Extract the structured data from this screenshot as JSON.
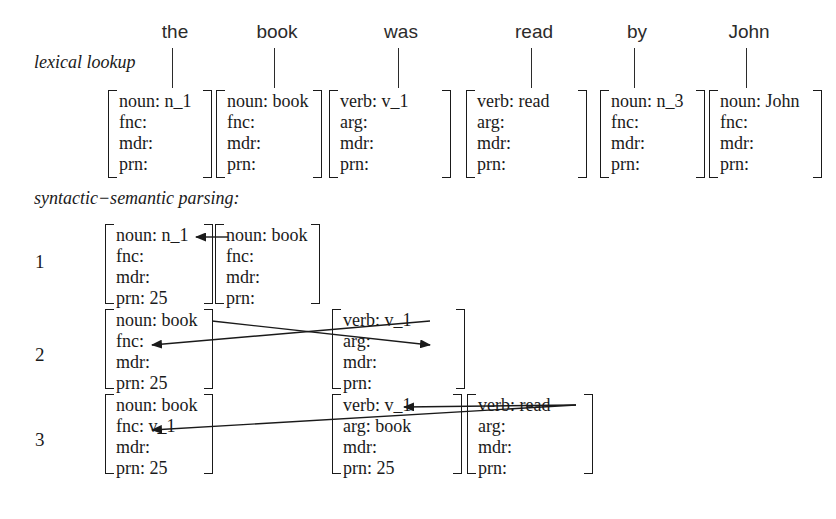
{
  "figure": {
    "title_sections": {
      "lexical": "lexical lookup",
      "parsing": "syntactic−semantic parsing:"
    },
    "sentence": [
      "the",
      "book",
      "was",
      "read",
      "by",
      "John"
    ],
    "colors": {
      "ink": "#1a1a1a",
      "word_ink": "#2b2b2b",
      "background": "#ffffff"
    }
  },
  "words": [
    {
      "text": "the",
      "cx": 175,
      "tick_top": 48,
      "tick_bottom": 88
    },
    {
      "text": "book",
      "cx": 277,
      "tick_top": 48,
      "tick_bottom": 88
    },
    {
      "text": "was",
      "cx": 401,
      "tick_top": 48,
      "tick_bottom": 88
    },
    {
      "text": "read",
      "cx": 534,
      "tick_top": 48,
      "tick_bottom": 88
    },
    {
      "text": "by",
      "cx": 637,
      "tick_top": 48,
      "tick_bottom": 88
    },
    {
      "text": "John",
      "cx": 749,
      "tick_top": 48,
      "tick_bottom": 88
    }
  ],
  "lexical_row": {
    "y": 90,
    "height": 88,
    "boxes": [
      {
        "x": 108,
        "w": 104,
        "attrs": [
          "noun: n_1",
          "fnc:",
          "mdr:",
          "prn:"
        ]
      },
      {
        "x": 216,
        "w": 106,
        "attrs": [
          "noun: book",
          "fnc:",
          "mdr:",
          "prn:"
        ]
      },
      {
        "x": 329,
        "w": 122,
        "attrs": [
          "verb: v_1",
          "arg:",
          "mdr:",
          "prn:"
        ]
      },
      {
        "x": 466,
        "w": 121,
        "attrs": [
          "verb: read",
          "arg:",
          "mdr:",
          "prn:"
        ]
      },
      {
        "x": 600,
        "w": 105,
        "attrs": [
          "noun: n_3",
          "fnc:",
          "mdr:",
          "prn:"
        ]
      },
      {
        "x": 709,
        "w": 113,
        "attrs": [
          "noun: John",
          "fnc:",
          "mdr:",
          "prn:"
        ]
      }
    ]
  },
  "parsing_rows": [
    {
      "number": "1",
      "num_x": 35,
      "num_y": 252,
      "y": 224,
      "height": 80,
      "boxes": [
        {
          "x": 105,
          "w": 108,
          "attrs": [
            "noun: n_1",
            "fnc:",
            "mdr:",
            "prn: 25"
          ]
        },
        {
          "x": 215,
          "w": 105,
          "attrs": [
            "noun: book",
            "fnc:",
            "mdr:",
            "prn:"
          ]
        }
      ],
      "arrows": [
        {
          "x1": 228,
          "y1": 237,
          "x2": 196,
          "y2": 237
        }
      ]
    },
    {
      "number": "2",
      "num_x": 35,
      "num_y": 345,
      "y": 309,
      "height": 80,
      "boxes": [
        {
          "x": 105,
          "w": 108,
          "attrs": [
            "noun: book",
            "fnc:",
            "mdr:",
            "prn: 25"
          ]
        },
        {
          "x": 332,
          "w": 133,
          "attrs": [
            "verb: v_1",
            "arg:",
            "mdr:",
            "prn:"
          ]
        }
      ],
      "arrows": [
        {
          "x1": 212,
          "y1": 321,
          "x2": 430,
          "y2": 345
        },
        {
          "x1": 430,
          "y1": 321,
          "x2": 152,
          "y2": 345
        }
      ]
    },
    {
      "number": "3",
      "num_x": 35,
      "num_y": 430,
      "y": 394,
      "height": 80,
      "boxes": [
        {
          "x": 105,
          "w": 108,
          "attrs": [
            "noun: book",
            "fnc: v_1",
            "mdr:",
            "prn: 25"
          ]
        },
        {
          "x": 332,
          "w": 130,
          "attrs": [
            "verb: v_1",
            "arg: book",
            "mdr:",
            "prn: 25"
          ]
        },
        {
          "x": 467,
          "w": 126,
          "attrs": [
            "verb: read",
            "arg:",
            "mdr:",
            "prn:"
          ]
        }
      ],
      "arrows": [
        {
          "x1": 576,
          "y1": 405,
          "x2": 404,
          "y2": 407
        },
        {
          "x1": 576,
          "y1": 405,
          "x2": 152,
          "y2": 430
        }
      ]
    }
  ]
}
